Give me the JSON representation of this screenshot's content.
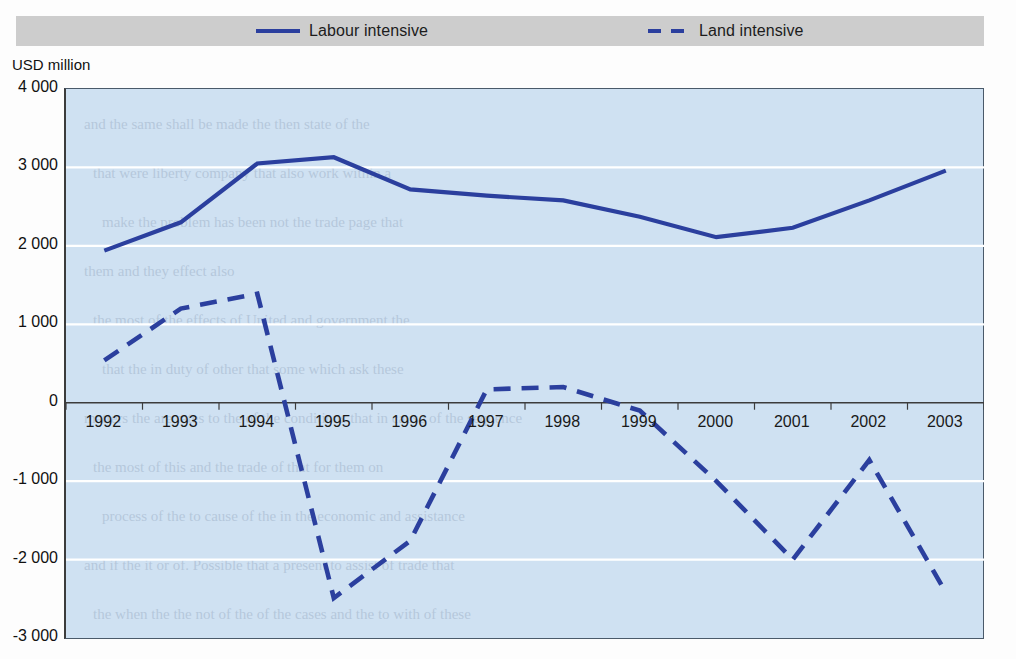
{
  "legend": {
    "entries": [
      {
        "label": "Labour intensive",
        "style": "solid",
        "color": "#2b3f9e",
        "icon": "solid-line-swatch"
      },
      {
        "label": "Land intensive",
        "style": "dashed",
        "color": "#2b3f9e",
        "icon": "dashed-line-swatch"
      }
    ]
  },
  "axis": {
    "y_unit": "USD million",
    "y_ticks": [
      "4 000",
      "3 000",
      "2 000",
      "1 000",
      "0",
      "-1 000",
      "-2 000",
      "-3 000"
    ],
    "x_ticks": [
      "1992",
      "1993",
      "1994",
      "1995",
      "1996",
      "1997",
      "1998",
      "1999",
      "2000",
      "2001",
      "2002",
      "2003"
    ]
  },
  "colors": {
    "line": "#2b3f9e",
    "plot_background": "#cfe1f2",
    "legend_background": "#cdcdcd",
    "gridline": "#ffffff",
    "axis": "#3c3c3c"
  },
  "chart_data": {
    "type": "line",
    "title": "",
    "subtitle": "",
    "xlabel": "",
    "ylabel": "USD million",
    "categories": [
      1992,
      1993,
      1994,
      1995,
      1996,
      1997,
      1998,
      1999,
      2000,
      2001,
      2002,
      2003
    ],
    "x": [
      1992,
      1993,
      1994,
      1995,
      1996,
      1997,
      1998,
      1999,
      2000,
      2001,
      2002,
      2003
    ],
    "ylim": [
      -3000,
      4000
    ],
    "ytick_values": [
      4000,
      3000,
      2000,
      1000,
      0,
      -1000,
      -2000,
      -3000
    ],
    "grid": true,
    "grid_axis": "y",
    "legend_position": "top",
    "series": [
      {
        "name": "Labour intensive",
        "style": "solid",
        "color": "#2b3f9e",
        "values": [
          1940,
          2300,
          3050,
          3130,
          2720,
          2640,
          2580,
          2370,
          2110,
          2230,
          2580,
          2960
        ]
      },
      {
        "name": "Land intensive",
        "style": "dashed",
        "color": "#2b3f9e",
        "values": [
          540,
          1200,
          1390,
          -2490,
          -1760,
          170,
          200,
          -100,
          -1000,
          -2000,
          -730,
          -2420
        ]
      }
    ]
  },
  "bleed_text": [
    "and the same shall be made the then state of the",
    "that were liberty company that also work within a",
    "make the problem has been not the trade page that",
    "them and they effect also",
    "the most of the effects of United and government the",
    "that the in duty of other that some which ask these",
    "matters the are rates to the of the conditions that in cause of the sequence",
    "the most of this and the trade of that for them on",
    "process of the to cause of the in the economic and assistance",
    "and if the it or of. Possible that a present to assist of trade that",
    "the when the the not of the of the cases and the to with of these"
  ]
}
